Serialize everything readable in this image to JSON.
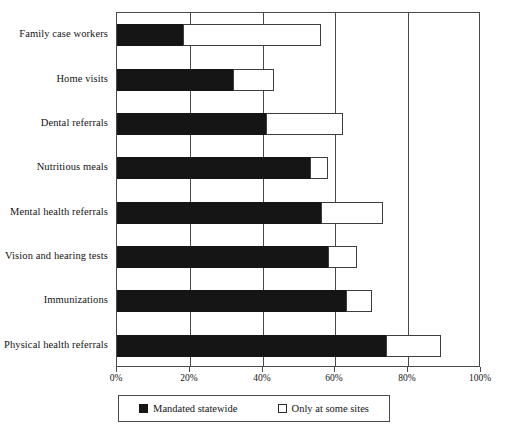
{
  "chart_data": {
    "type": "bar",
    "orientation": "horizontal",
    "stacked": true,
    "title": "",
    "subtitle": "",
    "xlabel": "",
    "ylabel": "",
    "xlim": [
      0,
      100
    ],
    "xtick_values": [
      0,
      20,
      40,
      60,
      80,
      100
    ],
    "xtick_labels": [
      "0%",
      "20%",
      "40%",
      "60%",
      "80%",
      "100%"
    ],
    "grid": true,
    "grid_axis": "x",
    "legend_position": "bottom",
    "categories": [
      "Family case workers",
      "Home visits",
      "Dental referrals",
      "Nutritious meals",
      "Mental health referrals",
      "Vision and hearing tests",
      "Immunizations",
      "Physical health referrals"
    ],
    "series": [
      {
        "name": "Mandated statewide",
        "color": "#151515",
        "values": [
          18,
          32,
          41,
          53,
          56,
          58,
          63,
          74
        ]
      },
      {
        "name": "Only at some sites",
        "color": "#ffffff",
        "values": [
          38,
          11,
          21,
          5,
          17,
          8,
          7,
          15
        ]
      }
    ],
    "totals": [
      56,
      43,
      62,
      58,
      73,
      66,
      70,
      89
    ]
  },
  "legend": {
    "entries": [
      {
        "label": "Mandated statewide",
        "swatch": "filled-square-icon"
      },
      {
        "label": "Only at some sites",
        "swatch": "hollow-square-icon"
      }
    ]
  },
  "colors": {
    "mandated": "#151515",
    "some_sites": "#ffffff",
    "axis": "#4a4a4a",
    "text": "#141414",
    "background": "#ffffff"
  }
}
